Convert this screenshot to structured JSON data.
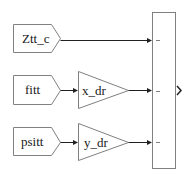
{
  "diagram": {
    "type": "simulink-block-diagram",
    "from_blocks": [
      {
        "label": "Ztt_c"
      },
      {
        "label": "fitt"
      },
      {
        "label": "psitt"
      }
    ],
    "gain_blocks": [
      {
        "label": "x_dr",
        "input": "fitt"
      },
      {
        "label": "y_dr",
        "input": "psitt"
      }
    ],
    "mux": {
      "label": "",
      "inputs": 3,
      "input_sources": [
        "Ztt_c",
        "x_dr",
        "y_dr"
      ],
      "output_symbol": ">"
    },
    "colors": {
      "block_border": "#808080",
      "wire": "#202020",
      "background": "#ffffff"
    }
  }
}
